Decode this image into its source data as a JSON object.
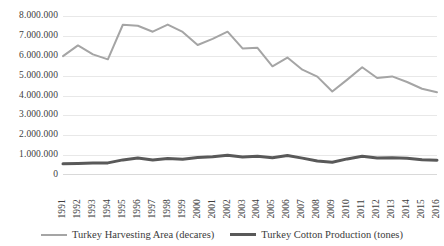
{
  "chart_data": {
    "type": "line",
    "title": "",
    "subtitle": "",
    "xlabel": "",
    "ylabel": "",
    "grid": true,
    "legend_position": "bottom",
    "ylim": [
      0,
      8000000
    ],
    "ytick_step": 1000000,
    "ytick_labels": [
      "8.000.000",
      "7.000.000",
      "6.000.000",
      "5.000.000",
      "4.000.000",
      "3.000.000",
      "2.000.000",
      "1.000.000",
      "0"
    ],
    "ytick_values": [
      8000000,
      7000000,
      6000000,
      5000000,
      4000000,
      3000000,
      2000000,
      1000000,
      0
    ],
    "categories": [
      "1991",
      "1992",
      "1993",
      "1994",
      "1995",
      "1996",
      "1997",
      "1998",
      "1999",
      "2000",
      "2001",
      "2002",
      "2003",
      "2004",
      "2005",
      "2006",
      "2007",
      "2008",
      "2009",
      "2010",
      "2011",
      "2012",
      "2013",
      "2014",
      "2015",
      "2016"
    ],
    "series": [
      {
        "name": "Turkey Harvesting Area (decares)",
        "color": "#a5a5a5",
        "width": 2,
        "values": [
          5980000,
          6520000,
          6070000,
          5820000,
          7560000,
          7510000,
          7210000,
          7570000,
          7200000,
          6540000,
          6850000,
          7210000,
          6370000,
          6400000,
          5470000,
          5910000,
          5300000,
          4950000,
          4200000,
          4800000,
          5420000,
          4880000,
          4960000,
          4680000,
          4340000,
          4160000
        ]
      },
      {
        "name": "Turkey Cotton Production (tones)",
        "color": "#595959",
        "width": 3,
        "values": [
          560000,
          580000,
          600000,
          610000,
          760000,
          860000,
          760000,
          830000,
          790000,
          880000,
          920000,
          990000,
          900000,
          940000,
          870000,
          980000,
          850000,
          700000,
          640000,
          810000,
          940000,
          860000,
          870000,
          840000,
          770000,
          740000
        ]
      }
    ]
  },
  "legend": {
    "items": [
      {
        "label": "Turkey Harvesting Area (decares)"
      },
      {
        "label": "Turkey Cotton Production (tones)"
      }
    ]
  }
}
